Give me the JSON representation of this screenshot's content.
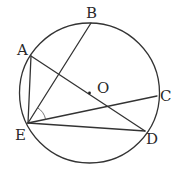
{
  "diagram": {
    "type": "circle-geometry",
    "circle": {
      "center_label": "O"
    },
    "points": [
      {
        "id": "A",
        "label": "A"
      },
      {
        "id": "B",
        "label": "B"
      },
      {
        "id": "C",
        "label": "C"
      },
      {
        "id": "D",
        "label": "D"
      },
      {
        "id": "E",
        "label": "E"
      },
      {
        "id": "O",
        "label": "O"
      }
    ],
    "segments": [
      [
        "A",
        "D"
      ],
      [
        "A",
        "E"
      ],
      [
        "E",
        "B"
      ],
      [
        "E",
        "C"
      ],
      [
        "E",
        "D"
      ]
    ],
    "marked_angles": [
      {
        "vertex": "E",
        "between": [
          "B",
          "C"
        ],
        "style": "single-arc"
      }
    ]
  },
  "labels": {
    "A": "A",
    "B": "B",
    "C": "C",
    "D": "D",
    "E": "E",
    "O": "O"
  }
}
